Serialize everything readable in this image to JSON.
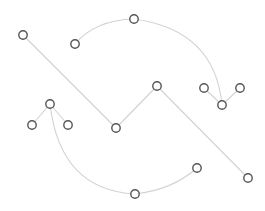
{
  "diagram": {
    "type": "node-link graph",
    "colors": {
      "background": "#ffffff",
      "edge": "#d2d2d2",
      "node_stroke": "#555555",
      "node_fill": "#ffffff"
    },
    "node_radius": 4.2,
    "nodes": [
      {
        "id": "A",
        "x": 23,
        "y": 35
      },
      {
        "id": "B",
        "x": 75,
        "y": 44
      },
      {
        "id": "C",
        "x": 134,
        "y": 19
      },
      {
        "id": "D",
        "x": 204,
        "y": 88
      },
      {
        "id": "E",
        "x": 240,
        "y": 88
      },
      {
        "id": "F",
        "x": 222,
        "y": 105
      },
      {
        "id": "G",
        "x": 157,
        "y": 86
      },
      {
        "id": "H",
        "x": 116,
        "y": 128
      },
      {
        "id": "I",
        "x": 50,
        "y": 104
      },
      {
        "id": "J",
        "x": 32,
        "y": 125
      },
      {
        "id": "K",
        "x": 68,
        "y": 125
      },
      {
        "id": "L",
        "x": 135,
        "y": 194
      },
      {
        "id": "M",
        "x": 197,
        "y": 168
      },
      {
        "id": "N",
        "x": 248,
        "y": 178
      }
    ],
    "edges": [
      {
        "from": "A",
        "to": "H",
        "shape": "line"
      },
      {
        "from": "H",
        "to": "G",
        "shape": "line"
      },
      {
        "from": "G",
        "to": "N",
        "shape": "line"
      },
      {
        "from": "B",
        "to": "C",
        "shape": "curve"
      },
      {
        "from": "C",
        "to": "F",
        "shape": "curve"
      },
      {
        "from": "F",
        "to": "D",
        "shape": "line"
      },
      {
        "from": "F",
        "to": "E",
        "shape": "line"
      },
      {
        "from": "I",
        "to": "J",
        "shape": "line"
      },
      {
        "from": "I",
        "to": "K",
        "shape": "line"
      },
      {
        "from": "I",
        "to": "L",
        "shape": "curve"
      },
      {
        "from": "L",
        "to": "M",
        "shape": "curve"
      }
    ]
  }
}
